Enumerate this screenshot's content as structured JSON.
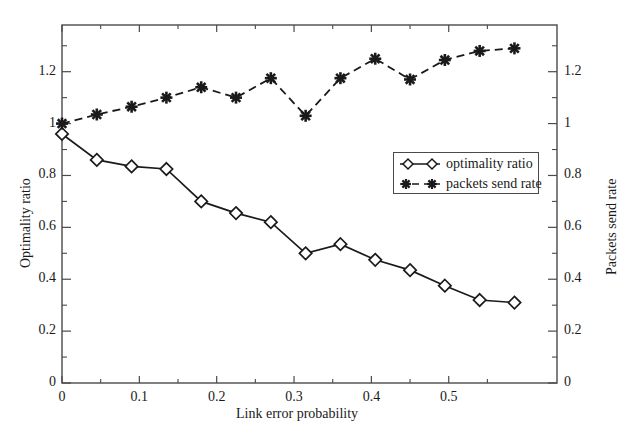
{
  "chart_data": {
    "type": "line",
    "title": "",
    "xlabel": "Link error probability",
    "ylabel": "Optimality ratio",
    "y2label": "Packets send rate",
    "xlim": [
      0,
      0.64
    ],
    "ylim": [
      0,
      1.38
    ],
    "y2lim": [
      0,
      1.38
    ],
    "grid": false,
    "legend_position": "center-right",
    "xticks": [
      "0",
      "0.1",
      "0.2",
      "0.3",
      "0.4",
      "0.5"
    ],
    "xtick_values": [
      0,
      0.1,
      0.2,
      0.3,
      0.4,
      0.5
    ],
    "yticks": [
      "0",
      "0.2",
      "0.4",
      "0.6",
      "0.8",
      "1",
      "1.2"
    ],
    "ytick_values": [
      0,
      0.2,
      0.4,
      0.6,
      0.8,
      1.0,
      1.2
    ],
    "y2ticks": [
      "0",
      "0.2",
      "0.4",
      "0.6",
      "0.8",
      "1",
      "1.2"
    ],
    "y2tick_values": [
      0,
      0.2,
      0.4,
      0.6,
      0.8,
      1.0,
      1.2
    ],
    "series": [
      {
        "name": "optimality ratio",
        "axis": "left",
        "marker": "diamond",
        "linestyle": "solid",
        "color": "#1a1a1a",
        "x": [
          0.0,
          0.045,
          0.09,
          0.135,
          0.18,
          0.225,
          0.27,
          0.315,
          0.36,
          0.405,
          0.45,
          0.495,
          0.54,
          0.585
        ],
        "y": [
          0.96,
          0.86,
          0.835,
          0.825,
          0.7,
          0.655,
          0.62,
          0.5,
          0.535,
          0.475,
          0.435,
          0.375,
          0.32,
          0.31
        ]
      },
      {
        "name": "packets send rate",
        "axis": "right",
        "marker": "star",
        "linestyle": "dashed",
        "color": "#1a1a1a",
        "x": [
          0.0,
          0.045,
          0.09,
          0.135,
          0.18,
          0.225,
          0.27,
          0.315,
          0.36,
          0.405,
          0.45,
          0.495,
          0.54,
          0.585
        ],
        "y": [
          1.0,
          1.035,
          1.065,
          1.1,
          1.14,
          1.1,
          1.175,
          1.03,
          1.175,
          1.25,
          1.17,
          1.245,
          1.28,
          1.29
        ]
      }
    ]
  },
  "legend": {
    "entries": [
      {
        "label": "optimality ratio",
        "marker": "diamond",
        "linestyle": "solid"
      },
      {
        "label": "packets send rate",
        "marker": "star",
        "linestyle": "dashed"
      }
    ]
  }
}
